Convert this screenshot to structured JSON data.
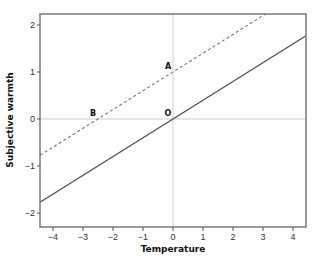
{
  "chart_data": {
    "type": "line",
    "title": "",
    "xlabel": "Temperature",
    "ylabel": "Subjective warmth",
    "xlim": [
      -4.43,
      4.43
    ],
    "ylim": [
      -2.25,
      2.25
    ],
    "x_ticks": [
      -4,
      -3,
      -2,
      -1,
      0,
      1,
      2,
      3,
      4
    ],
    "y_ticks": [
      -2,
      -1,
      0,
      1,
      2
    ],
    "grid": false,
    "reference_lines": [
      {
        "axis": "x",
        "value": 0,
        "color": "#d0d0d0"
      },
      {
        "axis": "y",
        "value": 0,
        "color": "#d0d0d0"
      }
    ],
    "series": [
      {
        "name": "baseline",
        "style": "solid",
        "color": "#555555",
        "slope": 0.4,
        "intercept": 0.0,
        "x": [
          -4.43,
          4.43
        ],
        "y": [
          -1.77,
          1.77
        ]
      },
      {
        "name": "shifted",
        "style": "dashed",
        "color": "#777777",
        "slope": 0.4,
        "intercept": 1.0,
        "x": [
          -4.43,
          3.1
        ],
        "y": [
          -0.77,
          2.24
        ]
      }
    ],
    "annotations": [
      {
        "label": "A",
        "x": 0,
        "y": 1
      },
      {
        "label": "B",
        "x": -2.5,
        "y": 0
      },
      {
        "label": "O",
        "x": 0,
        "y": 0
      }
    ],
    "legend": null
  }
}
